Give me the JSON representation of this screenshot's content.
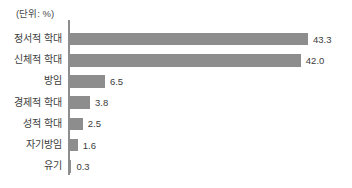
{
  "chart_data": {
    "type": "bar",
    "orientation": "horizontal",
    "title": "",
    "subtitle": "",
    "unit_note": "(단위: %)",
    "xlabel": "",
    "ylabel": "",
    "categories": [
      "정서적 학대",
      "신체적 학대",
      "방임",
      "경제적 학대",
      "성적 학대",
      "자기방임",
      "유기"
    ],
    "values": [
      43.3,
      42.0,
      6.5,
      3.8,
      2.5,
      1.6,
      0.3
    ],
    "value_labels": [
      "43.3",
      "42.0",
      "6.5",
      "3.8",
      "2.5",
      "1.6",
      "0.3"
    ],
    "xlim": [
      0,
      43.3
    ],
    "grid": false,
    "legend": false,
    "bar_color": "#8d8d8d",
    "axis_color": "#8d8d8d",
    "text_color": "#3c3c3c",
    "background": "#ffffff"
  }
}
